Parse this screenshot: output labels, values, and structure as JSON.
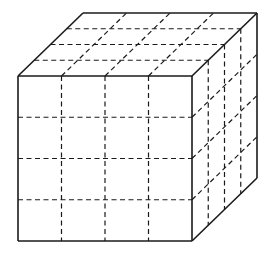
{
  "diagram": {
    "type": "cube-grid",
    "grid_divisions": 4,
    "colors": {
      "stroke": "#1a1a1a",
      "background": "#ffffff"
    },
    "front_face": {
      "x0": 18,
      "y0": 76,
      "x1": 192,
      "y1": 241
    },
    "depth_offset": {
      "dx": 65,
      "dy": -63
    }
  }
}
